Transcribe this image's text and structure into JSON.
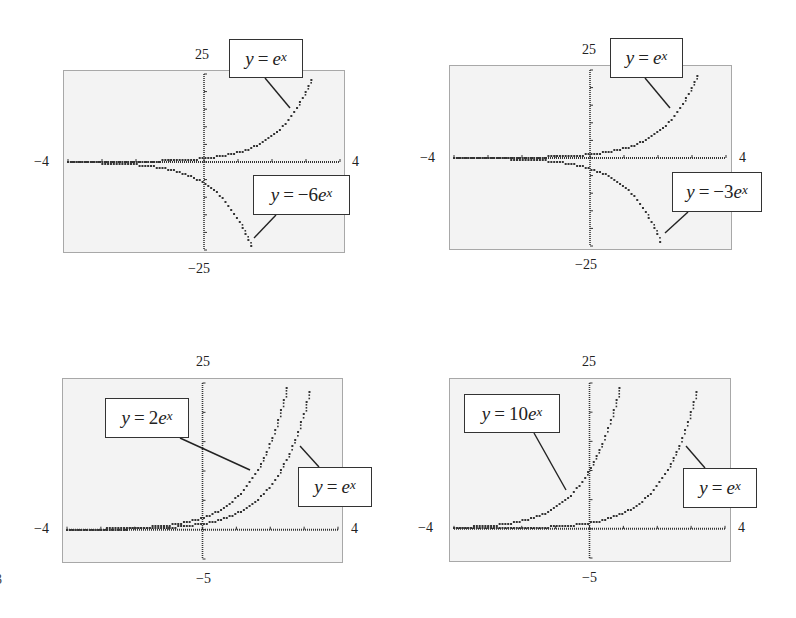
{
  "chart_data": [
    {
      "type": "line",
      "title": "",
      "xlim": [
        -4,
        4
      ],
      "ylim": [
        -25,
        25
      ],
      "tick_labels": {
        "xmin": "−4",
        "xmax": "4",
        "ymax": "25",
        "ymin": "−25"
      },
      "series": [
        {
          "name": "y = e^x",
          "coef": 1,
          "label": {
            "lhs": "y",
            "eq": "=",
            "coef": "",
            "base": "e",
            "exp": "x"
          }
        },
        {
          "name": "y = −6e^x",
          "coef": -6,
          "label": {
            "lhs": "y",
            "eq": "=",
            "coef": "−6",
            "base": "e",
            "exp": "x"
          }
        }
      ],
      "grid": false,
      "frame": {
        "left": 63,
        "top": 70,
        "right": 345,
        "bottom": 253
      },
      "axes_px": {
        "x0": 68,
        "x1": 340,
        "y_top": 74,
        "y_bottom": 250
      },
      "labels_px": [
        {
          "box": [
            229,
            39,
            303,
            78
          ],
          "leader": [
            265,
            78,
            290,
            108
          ]
        },
        {
          "box": [
            253,
            175,
            350,
            215
          ],
          "leader": [
            276,
            215,
            254,
            238
          ]
        }
      ],
      "tick_px": {
        "xmin": [
          34,
          155
        ],
        "xmax": [
          352,
          155
        ],
        "ymax": [
          195,
          48
        ],
        "ymin": [
          188,
          262
        ]
      }
    },
    {
      "type": "line",
      "title": "",
      "xlim": [
        -4,
        4
      ],
      "ylim": [
        -25,
        25
      ],
      "tick_labels": {
        "xmin": "−4",
        "xmax": "4",
        "ymax": "25",
        "ymin": "−25"
      },
      "series": [
        {
          "name": "y = e^x",
          "coef": 1,
          "label": {
            "lhs": "y",
            "eq": "=",
            "coef": "",
            "base": "e",
            "exp": "x"
          }
        },
        {
          "name": "y = −3e^x",
          "coef": -3,
          "label": {
            "lhs": "y",
            "eq": "=",
            "coef": "−3",
            "base": "e",
            "exp": "x"
          }
        }
      ],
      "grid": false,
      "frame": {
        "left": 449,
        "top": 65,
        "right": 732,
        "bottom": 250
      },
      "axes_px": {
        "x0": 454,
        "x1": 726,
        "y_top": 70,
        "y_bottom": 246
      },
      "labels_px": [
        {
          "box": [
            610,
            38,
            683,
            78
          ],
          "leader": [
            645,
            78,
            670,
            108
          ]
        },
        {
          "box": [
            672,
            172,
            762,
            212
          ],
          "leader": [
            688,
            212,
            665,
            233
          ]
        }
      ],
      "tick_px": {
        "xmin": [
          420,
          151
        ],
        "xmax": [
          739,
          151
        ],
        "ymax": [
          582,
          43
        ],
        "ymin": [
          575,
          258
        ]
      }
    },
    {
      "type": "line",
      "title": "",
      "xlim": [
        -4,
        4
      ],
      "ylim": [
        -5,
        25
      ],
      "tick_labels": {
        "xmin": "−4",
        "xmax": "4",
        "ymax": "25",
        "ymin": "−5"
      },
      "series": [
        {
          "name": "y = 2e^x",
          "coef": 2,
          "label": {
            "lhs": "y",
            "eq": "=",
            "coef": "2",
            "base": "e",
            "exp": "x"
          }
        },
        {
          "name": "y = e^x",
          "coef": 1,
          "label": {
            "lhs": "y",
            "eq": "=",
            "coef": "",
            "base": "e",
            "exp": "x"
          }
        }
      ],
      "grid": false,
      "frame": {
        "left": 62,
        "top": 378,
        "right": 343,
        "bottom": 563
      },
      "axes_px": {
        "x0": 67,
        "x1": 338,
        "y_top": 383,
        "y_bottom": 559
      },
      "labels_px": [
        {
          "box": [
            105,
            398,
            189,
            438
          ],
          "leader": [
            180,
            438,
            250,
            470
          ]
        },
        {
          "box": [
            298,
            467,
            372,
            507
          ],
          "leader": [
            300,
            446,
            319,
            467
          ]
        }
      ],
      "tick_px": {
        "xmin": [
          34,
          522
        ],
        "xmax": [
          351,
          522
        ],
        "ymax": [
          196,
          355
        ],
        "ymin": [
          196,
          572
        ]
      }
    },
    {
      "type": "line",
      "title": "",
      "xlim": [
        -4,
        4
      ],
      "ylim": [
        -5,
        25
      ],
      "tick_labels": {
        "xmin": "−4",
        "xmax": "4",
        "ymax": "25",
        "ymin": "−5"
      },
      "series": [
        {
          "name": "y = 10e^x",
          "coef": 10,
          "label": {
            "lhs": "y",
            "eq": "=",
            "coef": "10",
            "base": "e",
            "exp": "x"
          }
        },
        {
          "name": "y = e^x",
          "coef": 1,
          "label": {
            "lhs": "y",
            "eq": "=",
            "coef": "",
            "base": "e",
            "exp": "x"
          }
        }
      ],
      "grid": false,
      "frame": {
        "left": 449,
        "top": 378,
        "right": 731,
        "bottom": 562
      },
      "axes_px": {
        "x0": 454,
        "x1": 725,
        "y_top": 383,
        "y_bottom": 558
      },
      "labels_px": [
        {
          "box": [
            464,
            394,
            560,
            433
          ],
          "leader": [
            534,
            433,
            566,
            490
          ]
        },
        {
          "box": [
            683,
            468,
            757,
            508
          ],
          "leader": [
            686,
            446,
            705,
            468
          ]
        }
      ],
      "tick_px": {
        "xmin": [
          418,
          521
        ],
        "xmax": [
          738,
          521
        ],
        "ymax": [
          582,
          355
        ],
        "ymin": [
          582,
          571
        ]
      }
    }
  ],
  "colors": {
    "frame_bg": "#f3f3f3",
    "frame_border": "#a8a8a8",
    "curve": "#333333",
    "label_border": "#333333"
  },
  "edge_glyph": "3"
}
